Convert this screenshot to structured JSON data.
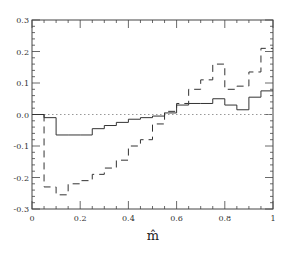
{
  "chart_data": {
    "type": "line",
    "subtype": "step-histogram",
    "title": "",
    "xlabel": "m̂",
    "ylabel": "",
    "xlim": [
      0,
      1
    ],
    "ylim": [
      -0.3,
      0.3
    ],
    "grid": false,
    "legend": null,
    "x_ticks": [
      "0",
      "0.2",
      "0.4",
      "0.6",
      "0.8",
      "1"
    ],
    "y_ticks": [
      "0.3",
      "0.2",
      "0.1",
      "0.0",
      "-0.1",
      "-0.2",
      "-0.3"
    ],
    "bin_edges": [
      0,
      0.05,
      0.1,
      0.15,
      0.2,
      0.25,
      0.3,
      0.35,
      0.4,
      0.45,
      0.5,
      0.55,
      0.6,
      0.65,
      0.7,
      0.75,
      0.8,
      0.85,
      0.9,
      0.95,
      1.0
    ],
    "series": [
      {
        "name": "solid",
        "style": "solid",
        "color": "#333333",
        "values": [
          0.0,
          -0.01,
          -0.065,
          -0.065,
          -0.065,
          -0.045,
          -0.035,
          -0.025,
          -0.015,
          -0.01,
          -0.005,
          0.005,
          0.03,
          0.035,
          0.035,
          0.05,
          0.03,
          0.015,
          0.055,
          0.075
        ]
      },
      {
        "name": "dashed",
        "style": "dashed",
        "color": "#333333",
        "values": [
          0.0,
          -0.23,
          -0.255,
          -0.22,
          -0.21,
          -0.19,
          -0.17,
          -0.145,
          -0.1,
          -0.08,
          -0.03,
          0.01,
          0.035,
          0.08,
          0.11,
          0.16,
          0.08,
          0.09,
          0.135,
          0.21
        ]
      }
    ],
    "reference_lines": [
      {
        "y": 0.0,
        "style": "dotted",
        "color": "#999999"
      }
    ]
  }
}
